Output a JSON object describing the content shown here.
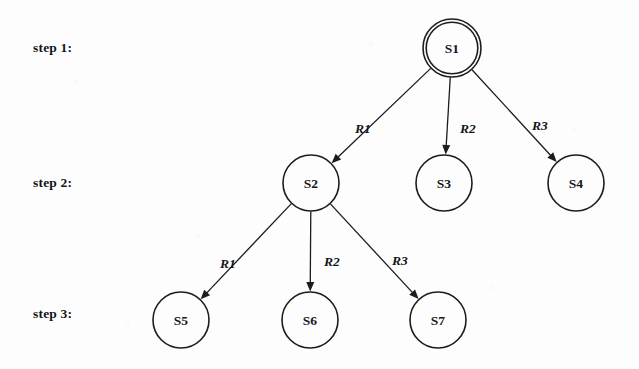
{
  "diagram": {
    "background_color": "#fdfdfd",
    "ink_color": "#1a1c20",
    "width": 639,
    "height": 369
  },
  "step_labels": [
    {
      "id": "step-1",
      "text": "step 1:",
      "x": 33,
      "y": 40
    },
    {
      "id": "step-2",
      "text": "step 2:",
      "x": 33,
      "y": 175
    },
    {
      "id": "step-3",
      "text": "step 3:",
      "x": 33,
      "y": 306
    }
  ],
  "nodes": [
    {
      "id": "S1",
      "label": "S1",
      "cx": 452,
      "cy": 48,
      "r": 29,
      "double_ring": true,
      "step": 1
    },
    {
      "id": "S2",
      "label": "S2",
      "cx": 311,
      "cy": 183,
      "r": 28,
      "double_ring": false,
      "step": 2
    },
    {
      "id": "S3",
      "label": "S3",
      "cx": 444,
      "cy": 183,
      "r": 28,
      "double_ring": false,
      "step": 2
    },
    {
      "id": "S4",
      "label": "S4",
      "cx": 576,
      "cy": 183,
      "r": 28,
      "double_ring": false,
      "step": 2
    },
    {
      "id": "S5",
      "label": "S5",
      "cx": 181,
      "cy": 320,
      "r": 28,
      "double_ring": false,
      "step": 3
    },
    {
      "id": "S6",
      "label": "S6",
      "cx": 310,
      "cy": 320,
      "r": 28,
      "double_ring": false,
      "step": 3
    },
    {
      "id": "S7",
      "label": "S7",
      "cx": 438,
      "cy": 320,
      "r": 28,
      "double_ring": false,
      "step": 3
    }
  ],
  "edges": [
    {
      "id": "e1",
      "from": "S1",
      "to": "S2",
      "label": "R1",
      "label_x": 363,
      "label_y": 128
    },
    {
      "id": "e2",
      "from": "S1",
      "to": "S3",
      "label": "R2",
      "label_x": 468,
      "label_y": 128
    },
    {
      "id": "e3",
      "from": "S1",
      "to": "S4",
      "label": "R3",
      "label_x": 540,
      "label_y": 125
    },
    {
      "id": "e4",
      "from": "S2",
      "to": "S5",
      "label": "R1",
      "label_x": 228,
      "label_y": 263
    },
    {
      "id": "e5",
      "from": "S2",
      "to": "S6",
      "label": "R2",
      "label_x": 332,
      "label_y": 261
    },
    {
      "id": "e6",
      "from": "S2",
      "to": "S7",
      "label": "R3",
      "label_x": 400,
      "label_y": 260
    }
  ]
}
